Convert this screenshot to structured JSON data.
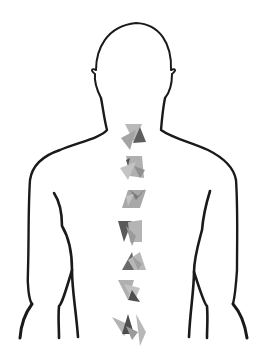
{
  "illustration": {
    "subject": "human torso back view outline with crystals along spine",
    "outline_color": "#1a1a1a",
    "background": "#ffffff",
    "crystal_count": 7,
    "crystal_colors": [
      "#5a5a5a",
      "#8a8a8a",
      "#a8a8a8",
      "#c0c0c0"
    ],
    "crystals": [
      {
        "name": "crystal-cluster-1",
        "cx": 133,
        "cy": 138
      },
      {
        "name": "crystal-cluster-2",
        "cx": 133,
        "cy": 168
      },
      {
        "name": "crystal-cluster-3",
        "cx": 133,
        "cy": 198
      },
      {
        "name": "crystal-cluster-4",
        "cx": 130,
        "cy": 231
      },
      {
        "name": "crystal-cluster-5",
        "cx": 134,
        "cy": 262
      },
      {
        "name": "crystal-cluster-6",
        "cx": 128,
        "cy": 290
      },
      {
        "name": "crystal-cluster-7",
        "cx": 131,
        "cy": 325
      }
    ]
  }
}
